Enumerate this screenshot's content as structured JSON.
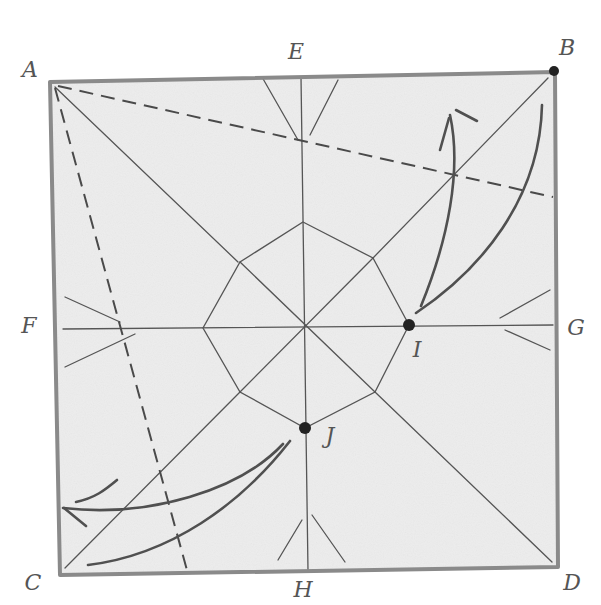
{
  "diagram": {
    "colors": {
      "paper": "#ededed",
      "border": "#8a8a8a",
      "crease": "#555555",
      "valley": "#4a4a4a",
      "arrow": "#505050",
      "dot": "#222222",
      "label": "#555555"
    },
    "corners": {
      "A": [
        50,
        82
      ],
      "B": [
        555,
        72
      ],
      "C": [
        60,
        575
      ],
      "D": [
        558,
        567
      ]
    },
    "labels": [
      {
        "id": "A",
        "text": "A",
        "x": 30,
        "y": 70
      },
      {
        "id": "B",
        "text": "B",
        "x": 567,
        "y": 48
      },
      {
        "id": "C",
        "text": "C",
        "x": 33,
        "y": 583
      },
      {
        "id": "D",
        "text": "D",
        "x": 572,
        "y": 583
      },
      {
        "id": "E",
        "text": "E",
        "x": 296,
        "y": 52
      },
      {
        "id": "F",
        "text": "F",
        "x": 29,
        "y": 326
      },
      {
        "id": "G",
        "text": "G",
        "x": 576,
        "y": 328
      },
      {
        "id": "H",
        "text": "H",
        "x": 303,
        "y": 590
      },
      {
        "id": "I",
        "text": "I",
        "x": 417,
        "y": 350
      },
      {
        "id": "J",
        "text": "J",
        "x": 330,
        "y": 436
      }
    ],
    "points": [
      {
        "id": "B",
        "x": 554,
        "y": 71,
        "r": 5
      },
      {
        "id": "I",
        "x": 409,
        "y": 325,
        "r": 6
      },
      {
        "id": "J",
        "x": 305,
        "y": 428,
        "r": 6
      }
    ],
    "octagon": [
      [
        303,
        222
      ],
      [
        373,
        258
      ],
      [
        409,
        325
      ],
      [
        375,
        392
      ],
      [
        305,
        428
      ],
      [
        240,
        392
      ],
      [
        203,
        328
      ],
      [
        240,
        262
      ]
    ],
    "center": [
      305,
      327
    ],
    "creases": [
      {
        "name": "diag-A-center",
        "x1": 55,
        "y1": 87,
        "x2": 238,
        "y2": 262
      },
      {
        "name": "diag-B-center",
        "x1": 548,
        "y1": 78,
        "x2": 373,
        "y2": 258
      },
      {
        "name": "diag-C-center",
        "x1": 65,
        "y1": 568,
        "x2": 240,
        "y2": 392
      },
      {
        "name": "diag-D-center",
        "x1": 552,
        "y1": 562,
        "x2": 375,
        "y2": 392
      },
      {
        "name": "inner-diag-1",
        "x1": 240,
        "y1": 262,
        "x2": 375,
        "y2": 392
      },
      {
        "name": "inner-diag-2",
        "x1": 373,
        "y1": 258,
        "x2": 240,
        "y2": 392
      },
      {
        "name": "vertical-E-H",
        "x1": 301,
        "y1": 77,
        "x2": 308,
        "y2": 571
      },
      {
        "name": "horizontal-F-G",
        "x1": 63,
        "y1": 329,
        "x2": 553,
        "y2": 325
      },
      {
        "name": "E-fan-left",
        "x1": 262,
        "y1": 77,
        "x2": 298,
        "y2": 140
      },
      {
        "name": "E-fan-right",
        "x1": 338,
        "y1": 80,
        "x2": 310,
        "y2": 135
      },
      {
        "name": "H-fan-left",
        "x1": 278,
        "y1": 560,
        "x2": 302,
        "y2": 520
      },
      {
        "name": "H-fan-right",
        "x1": 345,
        "y1": 562,
        "x2": 312,
        "y2": 515
      },
      {
        "name": "F-fan-top",
        "x1": 65,
        "y1": 297,
        "x2": 120,
        "y2": 322
      },
      {
        "name": "F-fan-bottom",
        "x1": 65,
        "y1": 367,
        "x2": 135,
        "y2": 334
      },
      {
        "name": "G-fan-top",
        "x1": 550,
        "y1": 290,
        "x2": 500,
        "y2": 318
      },
      {
        "name": "G-fan-bottom",
        "x1": 550,
        "y1": 350,
        "x2": 505,
        "y2": 330
      }
    ],
    "valley_folds": [
      {
        "name": "A-to-right-edge",
        "x1": 58,
        "y1": 86,
        "x2": 553,
        "y2": 197
      },
      {
        "name": "A-to-bottom-edge",
        "x1": 55,
        "y1": 88,
        "x2": 188,
        "y2": 574
      }
    ],
    "arrows": [
      {
        "name": "arrow-I-inner",
        "d": "M421 306 C 448 240, 462 170, 450 115"
      },
      {
        "name": "arrow-I-head-1",
        "d": "M449 118 L 440 150"
      },
      {
        "name": "arrow-I-head-2",
        "d": "M456 110 L 477 121"
      },
      {
        "name": "arrow-I-outer",
        "d": "M416 313 C 480 270, 540 200, 542 105"
      },
      {
        "name": "arrow-J-inner",
        "d": "M283 444 C 240 490, 150 518, 63 508"
      },
      {
        "name": "arrow-J-head-1",
        "d": "M64 508 L 86 526"
      },
      {
        "name": "arrow-J-head-2",
        "d": "M76 502 C 95 498, 105 490, 117 480"
      },
      {
        "name": "arrow-J-outer",
        "d": "M290 441 C 240 505, 170 555, 88 565"
      }
    ]
  }
}
